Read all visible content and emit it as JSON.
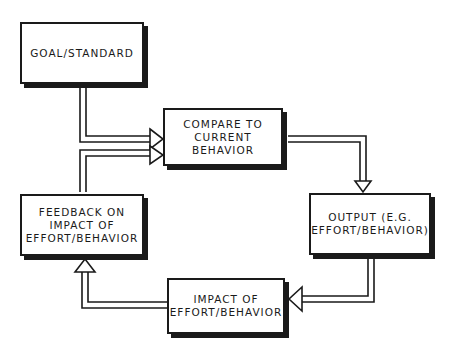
{
  "diagram": {
    "type": "flowchart-feedback-loop",
    "nodes": [
      {
        "id": "goal",
        "label": "GOAL/STANDARD"
      },
      {
        "id": "compare",
        "label": "COMPARE TO\nCURRENT\nBEHAVIOR"
      },
      {
        "id": "output",
        "label": "OUTPUT (E.G.\nEFFORT/BEHAVIOR)"
      },
      {
        "id": "impact",
        "label": "IMPACT OF\nEFFORT/BEHAVIOR"
      },
      {
        "id": "feedback",
        "label": "FEEDBACK ON\nIMPACT OF\nEFFORT/BEHAVIOR"
      }
    ],
    "edges": [
      {
        "from": "goal",
        "to": "compare"
      },
      {
        "from": "compare",
        "to": "output"
      },
      {
        "from": "output",
        "to": "impact"
      },
      {
        "from": "impact",
        "to": "feedback"
      },
      {
        "from": "feedback",
        "to": "compare"
      }
    ],
    "colors": {
      "ink": "#1a1a1a",
      "background": "#ffffff"
    }
  }
}
